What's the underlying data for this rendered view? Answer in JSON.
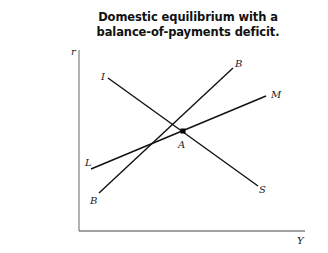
{
  "figure": {
    "title_line1": "Domestic equilibrium with a",
    "title_line2": "balance-of-payments deficit.",
    "axes": {
      "y_label": "r",
      "x_label": "Y"
    },
    "curves": [
      {
        "id": "IS",
        "start_label": "I",
        "end_label": "S",
        "description": "downward-sloping IS curve"
      },
      {
        "id": "BB",
        "start_label": "B",
        "end_label": "B",
        "description": "upward-sloping balance-of-payments curve (steeper)"
      },
      {
        "id": "LM",
        "start_label": "L",
        "end_label": "M",
        "description": "upward-sloping LM curve (flatter)"
      }
    ],
    "point": {
      "label": "A",
      "description": "IS–LM intersection, below/right of BB"
    }
  },
  "colors": {
    "line": "#111111",
    "axis": "#555555",
    "background": "#ffffff"
  }
}
